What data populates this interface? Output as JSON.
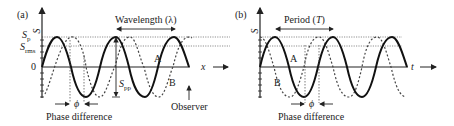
{
  "panel_a": {
    "label": "(a)",
    "y_axis_label": "S",
    "x_axis_label": "x",
    "sp_label": "S",
    "sp_sub": "p",
    "srms_label": "S",
    "srms_sub": "rms",
    "zero_label": "0",
    "wavelength_label": "Wavelength (λ)",
    "spp_label": "S",
    "spp_sub": "pp",
    "wave_a_label": "A",
    "wave_b_label": "B",
    "phi_label": "ϕ",
    "phase_difference_label": "Phase difference",
    "observer_label": "Observer"
  },
  "panel_b": {
    "label": "(b)",
    "y_axis_label": "S",
    "x_axis_label": "t",
    "period_label": "Period (T)",
    "wave_a_label": "A",
    "wave_b_label": "B",
    "phi_label": "ϕ",
    "phase_difference_label": "Phase difference"
  },
  "colors": {
    "ink": "#222222",
    "dotted": "#555555"
  }
}
